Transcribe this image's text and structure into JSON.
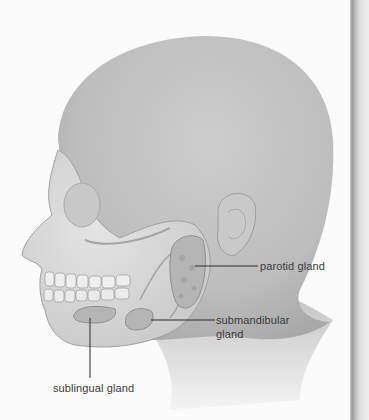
{
  "figure": {
    "labels": {
      "parotid": "parotid gland",
      "submandibular_line1": "submandibular",
      "submandibular_line2": "gland",
      "sublingual": "sublingual gland"
    }
  },
  "colors": {
    "page_background": "#fbfbfb",
    "skin": "#c4c4c4",
    "skull": "#dcdcdc",
    "gland": "#b5b5b5",
    "leader_line": "#2a2a2a",
    "label_text": "#3a3a3a"
  }
}
